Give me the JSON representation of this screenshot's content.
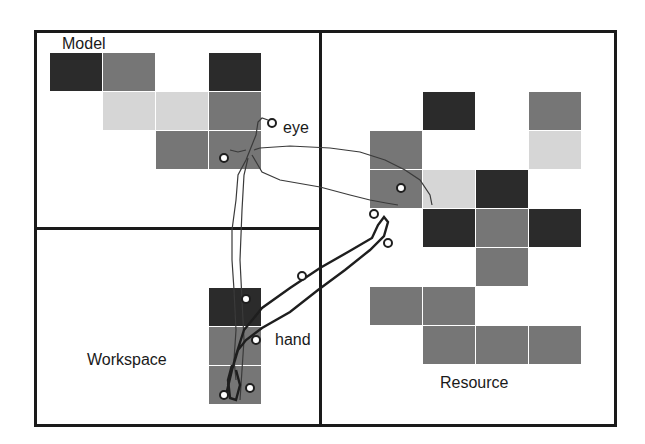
{
  "regions": {
    "model": {
      "label": "Model"
    },
    "workspace": {
      "label": "Workspace"
    },
    "resource": {
      "label": "Resource"
    }
  },
  "trace_labels": {
    "eye": "eye",
    "hand": "hand"
  },
  "colors": {
    "dark": "#2b2b2b",
    "mid": "#767676",
    "light": "#d6d6d6",
    "frame": "#1a1a1a"
  },
  "grids": {
    "model": [
      [
        "dark",
        "mid",
        "",
        "dark"
      ],
      [
        "",
        "light",
        "light",
        "mid"
      ],
      [
        "",
        "",
        "mid",
        "mid"
      ]
    ],
    "resource": [
      [
        "",
        "dark",
        "",
        "mid"
      ],
      [
        "mid",
        "",
        "",
        "light"
      ],
      [
        "mid",
        "light",
        "dark",
        ""
      ],
      [
        "",
        "dark",
        "mid",
        "dark"
      ],
      [
        "",
        "",
        "mid",
        ""
      ],
      [
        "mid",
        "mid",
        "",
        ""
      ],
      [
        "",
        "mid",
        "mid",
        "mid"
      ]
    ],
    "workspace": [
      [
        "dark"
      ],
      [
        "mid"
      ],
      [
        "mid"
      ]
    ]
  }
}
